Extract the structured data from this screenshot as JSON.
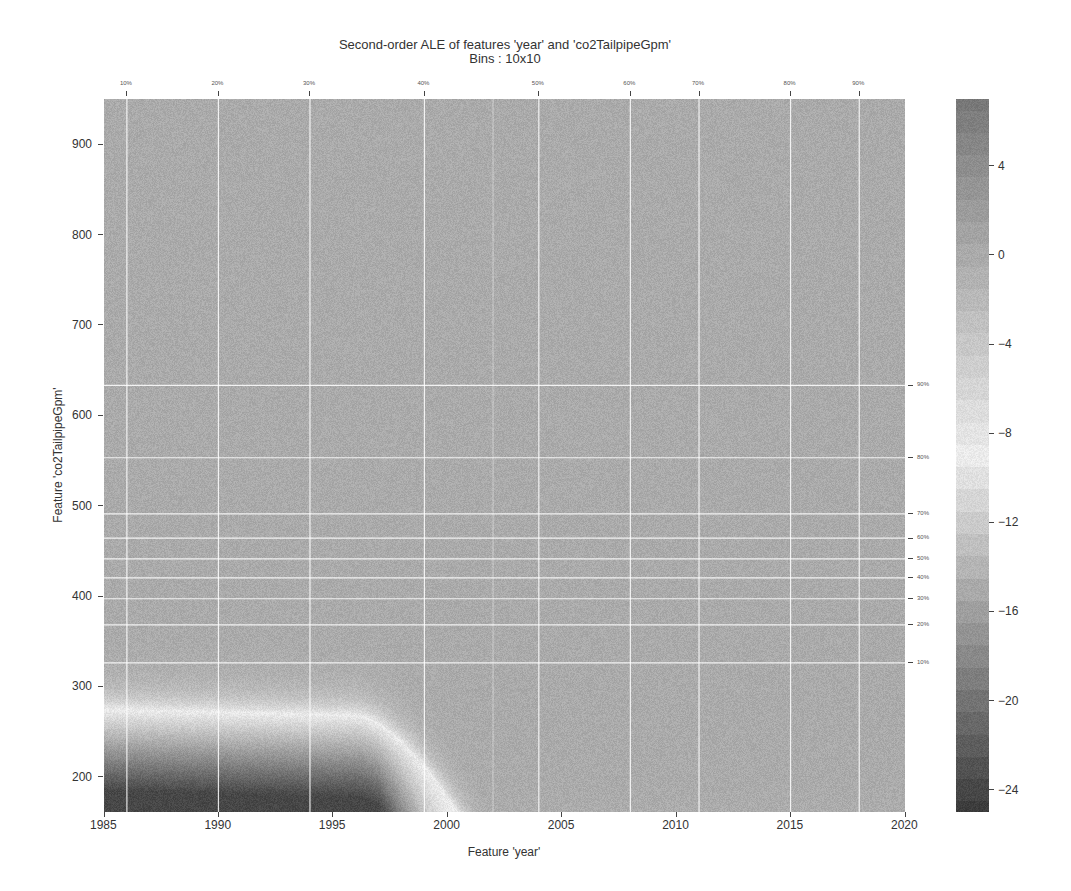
{
  "chart_data": {
    "type": "heatmap",
    "title": "Second-order ALE of features 'year' and 'co2TailpipeGpm'",
    "subtitle": "Bins : 10x10",
    "xlabel": "Feature 'year'",
    "ylabel": "Feature 'co2TailpipeGpm'",
    "xlim": [
      1985,
      2020
    ],
    "ylim": [
      161,
      950
    ],
    "x_ticks": [
      1985,
      1990,
      1995,
      2000,
      2005,
      2010,
      2015,
      2020
    ],
    "y_ticks": [
      200,
      300,
      400,
      500,
      600,
      700,
      800,
      900
    ],
    "x_percentiles": [
      {
        "label": "10%",
        "value": 1986
      },
      {
        "label": "20%",
        "value": 1990
      },
      {
        "label": "30%",
        "value": 1994
      },
      {
        "label": "40%",
        "value": 1999
      },
      {
        "label": "50%",
        "value": 2004
      },
      {
        "label": "60%",
        "value": 2008
      },
      {
        "label": "70%",
        "value": 2011
      },
      {
        "label": "80%",
        "value": 2015
      },
      {
        "label": "90%",
        "value": 2018
      }
    ],
    "y_percentiles": [
      {
        "label": "10%",
        "value": 326
      },
      {
        "label": "20%",
        "value": 368
      },
      {
        "label": "30%",
        "value": 397
      },
      {
        "label": "40%",
        "value": 420
      },
      {
        "label": "50%",
        "value": 441
      },
      {
        "label": "60%",
        "value": 464
      },
      {
        "label": "70%",
        "value": 491
      },
      {
        "label": "80%",
        "value": 553
      },
      {
        "label": "90%",
        "value": 633
      }
    ],
    "colorbar": {
      "ticks": [
        4,
        0,
        -4,
        -8,
        -12,
        -16,
        -20,
        -24
      ],
      "range": [
        -25,
        7
      ],
      "colormap": "grayscale (dark=low and high extremes, light near -8 to -10)"
    },
    "grid": true,
    "legend": "colorbar right"
  },
  "axes": {
    "x_tick_labels": [
      "1985",
      "1990",
      "1995",
      "2000",
      "2005",
      "2010",
      "2015",
      "2020"
    ],
    "y_tick_labels": [
      "200",
      "300",
      "400",
      "500",
      "600",
      "700",
      "800",
      "900"
    ],
    "colorbar_labels": [
      "4",
      "0",
      "−4",
      "−8",
      "−12",
      "−16",
      "−20",
      "−24"
    ]
  }
}
